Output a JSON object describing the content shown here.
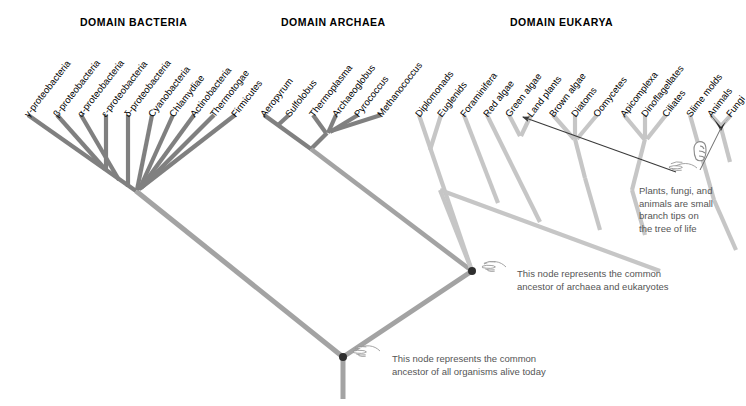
{
  "figure": {
    "background_color": "#ffffff",
    "branch_color_bacteria": "#808080",
    "branch_color_archaea": "#808080",
    "branch_color_eukarya": "#c8c8c8",
    "branch_color_trunk": "#a0a0a0",
    "node_marker_color": "#333333",
    "annotation_text_color": "#555555",
    "arrow_color": "#444444"
  },
  "domains": [
    {
      "id": "bacteria",
      "label": "DOMAIN BACTERIA",
      "x": 80,
      "y": 16
    },
    {
      "id": "archaea",
      "label": "DOMAIN ARCHAEA",
      "x": 281,
      "y": 16
    },
    {
      "id": "eukarya",
      "label": "DOMAIN EUKARYA",
      "x": 510,
      "y": 16
    }
  ],
  "taxa": {
    "bacteria": [
      {
        "name": "γ-proteobacteria",
        "tip_x": 28,
        "label_x": 26,
        "label_y": 110
      },
      {
        "name": "β-proteobacteria",
        "tip_x": 57,
        "label_x": 55,
        "label_y": 110
      },
      {
        "name": "α-proteobacteria",
        "tip_x": 81,
        "label_x": 79,
        "label_y": 110
      },
      {
        "name": "ε-proteobacteria",
        "tip_x": 105,
        "label_x": 103,
        "label_y": 110
      },
      {
        "name": "δ-proteobacteria",
        "tip_x": 128,
        "label_x": 126,
        "label_y": 110
      },
      {
        "name": "Cyanobacteria",
        "tip_x": 152,
        "label_x": 150,
        "label_y": 110
      },
      {
        "name": "Chlamydiae",
        "tip_x": 173,
        "label_x": 171,
        "label_y": 110
      },
      {
        "name": "Actinobacteria",
        "tip_x": 194,
        "label_x": 192,
        "label_y": 110
      },
      {
        "name": "Thermotogae",
        "tip_x": 214,
        "label_x": 212,
        "label_y": 110
      },
      {
        "name": "Firmicutes",
        "tip_x": 235,
        "label_x": 233,
        "label_y": 110
      }
    ],
    "archaea": [
      {
        "name": "Aeropyrum",
        "tip_x": 264,
        "label_x": 262,
        "label_y": 110
      },
      {
        "name": "Sulfolobus",
        "tip_x": 289,
        "label_x": 287,
        "label_y": 110
      },
      {
        "name": "Thermoplasma",
        "tip_x": 313,
        "label_x": 311,
        "label_y": 110
      },
      {
        "name": "Archaeoglobus",
        "tip_x": 336,
        "label_x": 334,
        "label_y": 110
      },
      {
        "name": "Pyrococcus",
        "tip_x": 358,
        "label_x": 356,
        "label_y": 110
      },
      {
        "name": "Methanococcus",
        "tip_x": 381,
        "label_x": 379,
        "label_y": 110
      }
    ],
    "eukarya": [
      {
        "name": "Diplomonads",
        "tip_x": 419,
        "label_x": 417,
        "label_y": 110
      },
      {
        "name": "Euglenids",
        "tip_x": 441,
        "label_x": 439,
        "label_y": 110
      },
      {
        "name": "Foraminifera",
        "tip_x": 464,
        "label_x": 462,
        "label_y": 110
      },
      {
        "name": "Red algae",
        "tip_x": 487,
        "label_x": 485,
        "label_y": 110
      },
      {
        "name": "Green algae",
        "tip_x": 509,
        "label_x": 507,
        "label_y": 110
      },
      {
        "name": "Land plants",
        "tip_x": 531,
        "label_x": 529,
        "label_y": 110
      },
      {
        "name": "Brown algae",
        "tip_x": 553,
        "label_x": 551,
        "label_y": 110
      },
      {
        "name": "Diatoms",
        "tip_x": 575,
        "label_x": 573,
        "label_y": 110
      },
      {
        "name": "Oomycetes",
        "tip_x": 597,
        "label_x": 595,
        "label_y": 110
      },
      {
        "name": "Apicomplexa",
        "tip_x": 624,
        "label_x": 622,
        "label_y": 110
      },
      {
        "name": "Dinoflagellates",
        "tip_x": 645,
        "label_x": 643,
        "label_y": 110
      },
      {
        "name": "Ciliates",
        "tip_x": 666,
        "label_x": 664,
        "label_y": 110
      },
      {
        "name": "Slime molds",
        "tip_x": 690,
        "label_x": 688,
        "label_y": 110
      },
      {
        "name": "Animals",
        "tip_x": 711,
        "label_x": 709,
        "label_y": 110
      },
      {
        "name": "Fungi",
        "tip_x": 730,
        "label_x": 728,
        "label_y": 110
      }
    ]
  },
  "annotations": [
    {
      "id": "branch-tips-note",
      "text": "Plants, fungi, and\nanimals are small\nbranch tips on\nthe tree of life",
      "x": 639,
      "y": 185
    },
    {
      "id": "archaea-eukaryote-ancestor-note",
      "text": "This node represents the common\nancestor of archaea and eukaryotes",
      "x": 517,
      "y": 268
    },
    {
      "id": "universal-ancestor-note",
      "text": "This node represents the common\nancestor of all organisms alive today",
      "x": 392,
      "y": 353
    }
  ],
  "nodes": [
    {
      "id": "root-node",
      "label": "common ancestor of all organisms alive today",
      "x": 343,
      "y": 357
    },
    {
      "id": "archaea-eukarya-node",
      "label": "common ancestor of archaea and eukaryotes",
      "x": 472,
      "y": 271
    }
  ],
  "icons": [
    {
      "id": "hand-pointer-plants",
      "name": "pointing-hand-icon",
      "x": 686,
      "y": 150
    },
    {
      "id": "hand-pointer-archaea",
      "name": "pointing-hand-icon",
      "x": 487,
      "y": 266
    },
    {
      "id": "hand-pointer-root",
      "name": "pointing-hand-icon",
      "x": 358,
      "y": 351
    }
  ]
}
